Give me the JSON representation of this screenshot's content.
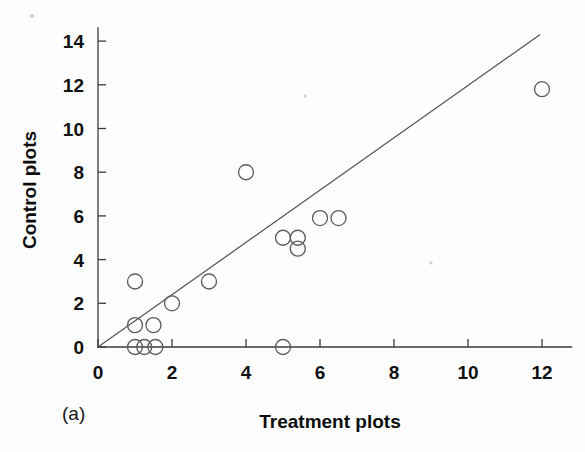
{
  "figure": {
    "panel_label": "(a)",
    "background_color": "#fdfdfd",
    "width": 585,
    "height": 452
  },
  "chart_data": {
    "type": "scatter",
    "title": "",
    "subtitle": "",
    "xlabel": "Treatment plots",
    "ylabel": "Control plots",
    "xlim": [
      0,
      12.8
    ],
    "ylim": [
      0,
      14.6
    ],
    "xticks": [
      0,
      2,
      4,
      6,
      8,
      10,
      12
    ],
    "yticks": [
      0,
      2,
      4,
      6,
      8,
      10,
      12,
      14
    ],
    "xtick_labels": [
      "0",
      "2",
      "4",
      "6",
      "8",
      "10",
      "12"
    ],
    "ytick_labels": [
      "0",
      "2",
      "4",
      "6",
      "8",
      "10",
      "12",
      "14"
    ],
    "grid": false,
    "legend": null,
    "marker": {
      "shape": "open-circle",
      "radius": 7.5,
      "edge_color": "#5d5d5d",
      "fill": "none"
    },
    "points": [
      {
        "x": 1.0,
        "y": 0.0
      },
      {
        "x": 1.25,
        "y": 0.0
      },
      {
        "x": 1.55,
        "y": 0.0
      },
      {
        "x": 1.0,
        "y": 1.0
      },
      {
        "x": 1.5,
        "y": 1.0
      },
      {
        "x": 1.0,
        "y": 3.0
      },
      {
        "x": 2.0,
        "y": 2.0
      },
      {
        "x": 3.0,
        "y": 3.0
      },
      {
        "x": 4.0,
        "y": 8.0
      },
      {
        "x": 5.0,
        "y": 0.0
      },
      {
        "x": 5.0,
        "y": 5.0
      },
      {
        "x": 5.4,
        "y": 5.0
      },
      {
        "x": 5.4,
        "y": 4.5
      },
      {
        "x": 6.0,
        "y": 5.9
      },
      {
        "x": 6.5,
        "y": 5.9
      },
      {
        "x": 12.0,
        "y": 11.8
      }
    ],
    "reference_line": {
      "name": "one-to-one line",
      "type": "line",
      "from": {
        "x": 0.0,
        "y": 0.0
      },
      "to": {
        "x": 11.95,
        "y": 14.3
      },
      "color": "#555555"
    }
  }
}
